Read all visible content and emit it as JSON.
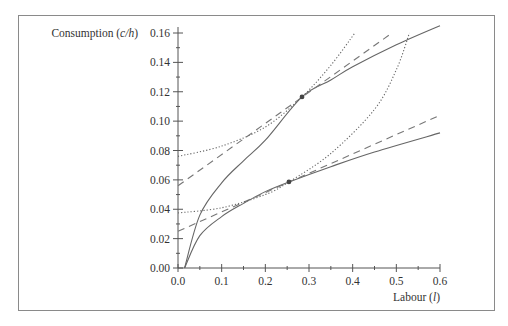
{
  "chart_data": {
    "type": "line",
    "title": "",
    "xlabel": "Labour (l)",
    "ylabel": "Consumption (c/h)",
    "xlabel_text": "Labour (",
    "xlabel_var": "l",
    "ylabel_text": "Consumption (",
    "ylabel_var": "c/h",
    "xlim": [
      0.0,
      0.6
    ],
    "ylim": [
      0.0,
      0.16
    ],
    "x_ticks": [
      "0.0",
      "0.1",
      "0.2",
      "0.3",
      "0.4",
      "0.5",
      "0.6"
    ],
    "y_ticks": [
      "0.00",
      "0.02",
      "0.04",
      "0.06",
      "0.08",
      "0.10",
      "0.12",
      "0.14",
      "0.16"
    ],
    "grid": false,
    "legend": null,
    "series": [
      {
        "name": "upper budget curve",
        "style": "solid",
        "x": [
          0.015,
          0.05,
          0.1,
          0.15,
          0.2,
          0.284,
          0.35,
          0.4,
          0.5,
          0.6
        ],
        "values": [
          0.0,
          0.036,
          0.058,
          0.073,
          0.087,
          0.1165,
          0.128,
          0.137,
          0.152,
          0.165
        ]
      },
      {
        "name": "upper tangent line",
        "style": "dashed",
        "x": [
          0.0,
          0.49
        ],
        "values": [
          0.056,
          0.16
        ]
      },
      {
        "name": "upper indifference curve",
        "style": "dotted",
        "x": [
          0.0,
          0.1,
          0.2,
          0.284,
          0.35,
          0.405
        ],
        "values": [
          0.076,
          0.083,
          0.096,
          0.1165,
          0.138,
          0.16
        ]
      },
      {
        "name": "lower budget curve",
        "style": "solid",
        "x": [
          0.015,
          0.05,
          0.1,
          0.15,
          0.2,
          0.254,
          0.35,
          0.45,
          0.6
        ],
        "values": [
          0.0,
          0.022,
          0.035,
          0.044,
          0.052,
          0.0586,
          0.069,
          0.079,
          0.092
        ]
      },
      {
        "name": "lower tangent line",
        "style": "dashed",
        "x": [
          0.0,
          0.6
        ],
        "values": [
          0.025,
          0.104
        ]
      },
      {
        "name": "lower indifference curve",
        "style": "dotted",
        "x": [
          0.0,
          0.1,
          0.2,
          0.254,
          0.35,
          0.45,
          0.5,
          0.53
        ],
        "values": [
          0.0375,
          0.041,
          0.05,
          0.0586,
          0.078,
          0.108,
          0.135,
          0.16
        ]
      }
    ],
    "points": [
      {
        "name": "upper optimum",
        "x": 0.284,
        "y": 0.1165
      },
      {
        "name": "lower optimum",
        "x": 0.254,
        "y": 0.0586
      }
    ]
  }
}
